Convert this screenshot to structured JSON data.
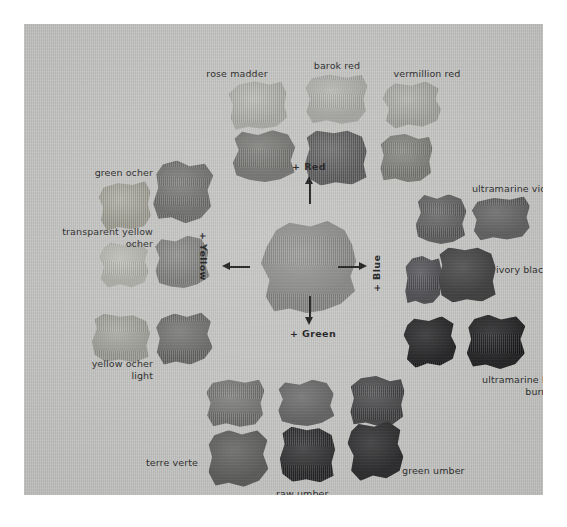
{
  "figure": {
    "kind": "pigment-swatch-chart",
    "plate_background": "#c3c3c1",
    "page_background": "#ffffff",
    "rendering": "grayscale halftone reproduction"
  },
  "axes": {
    "up": {
      "label": "+ Red",
      "direction": "up",
      "rotation": "none"
    },
    "right": {
      "label": "+ Blue",
      "direction": "right",
      "rotation": "counter-clockwise"
    },
    "down": {
      "label": "+ Green",
      "direction": "down",
      "rotation": "none"
    },
    "left": {
      "label": "+ Yellow",
      "direction": "left",
      "rotation": "clockwise"
    }
  },
  "labels": [
    {
      "id": "rose-madder",
      "text": "rose madder",
      "align": "center",
      "x": 167,
      "y": 44,
      "w": 92
    },
    {
      "id": "barok-red",
      "text": "barok red",
      "align": "center",
      "x": 272,
      "y": 36,
      "w": 82
    },
    {
      "id": "vermillion-red",
      "text": "vermillion red",
      "align": "center",
      "x": 355,
      "y": 44,
      "w": 96
    },
    {
      "id": "green-ocher",
      "text": "green ocher",
      "align": "right",
      "x": 22,
      "y": 143,
      "w": 107
    },
    {
      "id": "transparent-yellow-ocher",
      "text": "transparent yellow\nocher",
      "align": "right",
      "x": 17,
      "y": 202,
      "w": 112
    },
    {
      "id": "yellow-ocher-light",
      "text": "yellow ocher\nlight",
      "align": "right",
      "x": 25,
      "y": 334,
      "w": 104
    },
    {
      "id": "ultramarine-violet",
      "text": "ultramarine violet",
      "align": "left",
      "x": 448,
      "y": 159,
      "w": 118
    },
    {
      "id": "ivory-black",
      "text": "ivory black",
      "align": "left",
      "x": 472,
      "y": 240,
      "w": 84
    },
    {
      "id": "ultramarine-blue-plus-burnt-umber",
      "text": "ultramarine blue plus\nburnt umber",
      "align": "right",
      "x": 432,
      "y": 350,
      "w": 130
    },
    {
      "id": "terre-verte",
      "text": "terre verte",
      "align": "left",
      "x": 122,
      "y": 433,
      "w": 78
    },
    {
      "id": "raw-umber",
      "text": "raw umber",
      "align": "left",
      "x": 252,
      "y": 464,
      "w": 76
    },
    {
      "id": "green-umber",
      "text": "green umber",
      "align": "left",
      "x": 378,
      "y": 441,
      "w": 86
    }
  ],
  "swatches": [
    {
      "id": "rose-madder-swatch",
      "tone": "#b8b8b4",
      "x": 205,
      "y": 57,
      "w": 58,
      "h": 48,
      "rot": -3,
      "shape": "blob-a"
    },
    {
      "id": "barok-red-swatch",
      "tone": "#b5b5b1",
      "x": 281,
      "y": 50,
      "w": 62,
      "h": 50,
      "rot": 2,
      "shape": "blob-b"
    },
    {
      "id": "vermillion-red-swatch",
      "tone": "#b0b0ac",
      "x": 359,
      "y": 58,
      "w": 58,
      "h": 46,
      "rot": -2,
      "shape": "blob-c"
    },
    {
      "id": "rose-madder-dark-swatch",
      "tone": "#72726f",
      "x": 209,
      "y": 106,
      "w": 62,
      "h": 52,
      "rot": 1,
      "shape": "blob-d"
    },
    {
      "id": "barok-red-dark-swatch",
      "tone": "#59595a",
      "x": 281,
      "y": 106,
      "w": 62,
      "h": 55,
      "rot": -2,
      "shape": "blob-e"
    },
    {
      "id": "vermillion-dark-swatch",
      "tone": "#7e7e7a",
      "x": 356,
      "y": 110,
      "w": 52,
      "h": 48,
      "rot": 3,
      "shape": "blob-a"
    },
    {
      "id": "green-ocher-swatch",
      "tone": "#abab9f",
      "x": 75,
      "y": 158,
      "w": 52,
      "h": 48,
      "rot": -2,
      "shape": "blob-b"
    },
    {
      "id": "green-ocher-dark-swatch",
      "tone": "#6e6e6c",
      "x": 130,
      "y": 137,
      "w": 58,
      "h": 62,
      "rot": 4,
      "shape": "blob-f"
    },
    {
      "id": "transparent-yellow-ocher-swatch",
      "tone": "#bfbfb8",
      "x": 75,
      "y": 218,
      "w": 50,
      "h": 46,
      "rot": 2,
      "shape": "blob-c"
    },
    {
      "id": "transparent-yellow-ocher-dark-swatch",
      "tone": "#828280",
      "x": 131,
      "y": 212,
      "w": 54,
      "h": 52,
      "rot": -3,
      "shape": "blob-d"
    },
    {
      "id": "yellow-ocher-light-swatch",
      "tone": "#a9a9a1",
      "x": 68,
      "y": 290,
      "w": 58,
      "h": 48,
      "rot": 1,
      "shape": "blob-e"
    },
    {
      "id": "yellow-ocher-light-dark-swatch",
      "tone": "#6b6b69",
      "x": 132,
      "y": 289,
      "w": 56,
      "h": 52,
      "rot": -4,
      "shape": "blob-f"
    },
    {
      "id": "center-mixture-swatch",
      "tone": "#8b8b89",
      "x": 237,
      "y": 197,
      "w": 95,
      "h": 92,
      "rot": 0,
      "shape": "blob-center"
    },
    {
      "id": "ultramarine-violet-swatch",
      "tone": "#5d5d5e",
      "x": 448,
      "y": 173,
      "w": 58,
      "h": 43,
      "rot": -1,
      "shape": "blob-b"
    },
    {
      "id": "blue-left-swatch",
      "tone": "#5a5a5b",
      "x": 392,
      "y": 170,
      "w": 50,
      "h": 50,
      "rot": 3,
      "shape": "blob-d"
    },
    {
      "id": "ivory-black-swatch",
      "tone": "#343435",
      "x": 414,
      "y": 223,
      "w": 58,
      "h": 55,
      "rot": -2,
      "shape": "blob-e"
    },
    {
      "id": "ivory-black-left-swatch",
      "tone": "#45454a",
      "x": 381,
      "y": 232,
      "w": 36,
      "h": 48,
      "rot": 2,
      "shape": "blob-a"
    },
    {
      "id": "ultramarine-burnt-umber-swatch",
      "tone": "#121214",
      "x": 443,
      "y": 291,
      "w": 58,
      "h": 54,
      "rot": 1,
      "shape": "blob-f"
    },
    {
      "id": "black-left-swatch",
      "tone": "#131315",
      "x": 380,
      "y": 293,
      "w": 52,
      "h": 50,
      "rot": -3,
      "shape": "blob-c"
    },
    {
      "id": "terre-verte-light-swatch",
      "tone": "#757573",
      "x": 182,
      "y": 355,
      "w": 58,
      "h": 48,
      "rot": 2,
      "shape": "blob-b"
    },
    {
      "id": "green-mid-swatch",
      "tone": "#626263",
      "x": 254,
      "y": 356,
      "w": 56,
      "h": 46,
      "rot": -2,
      "shape": "blob-d"
    },
    {
      "id": "green-umber-upper-swatch",
      "tone": "#3f3f41",
      "x": 326,
      "y": 352,
      "w": 54,
      "h": 50,
      "rot": 3,
      "shape": "blob-a"
    },
    {
      "id": "terre-verte-swatch",
      "tone": "#5a5a58",
      "x": 184,
      "y": 406,
      "w": 60,
      "h": 57,
      "rot": -2,
      "shape": "blob-f"
    },
    {
      "id": "raw-umber-swatch",
      "tone": "#242426",
      "x": 256,
      "y": 403,
      "w": 55,
      "h": 55,
      "rot": 1,
      "shape": "blob-e"
    },
    {
      "id": "green-umber-swatch",
      "tone": "#1e1e20",
      "x": 324,
      "y": 398,
      "w": 55,
      "h": 58,
      "rot": -3,
      "shape": "blob-c"
    }
  ]
}
